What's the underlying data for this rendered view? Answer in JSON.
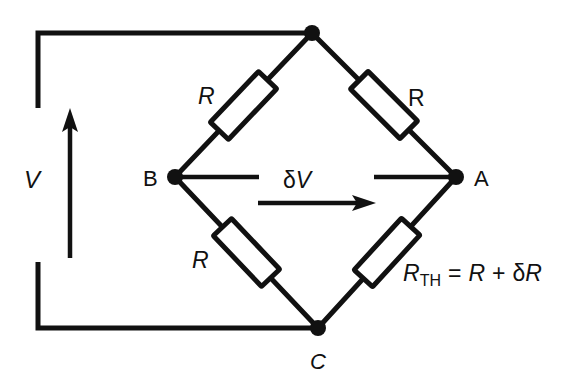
{
  "figure": {
    "type": "wheatstone-bridge-circuit-diagram",
    "background_color": "#ffffff",
    "stroke_color": "#111111"
  },
  "labels": {
    "source_voltage": "V",
    "node_a": "A",
    "node_b": "B",
    "node_c": "C",
    "resistor_top_left": "R",
    "resistor_top_right": "R",
    "resistor_bottom_left": "R",
    "bridge_voltage": "δV",
    "equation": {
      "symbol": "R",
      "subscript": "TH",
      "equals": "=",
      "term_one": "R",
      "plus": "+",
      "delta": "δ",
      "term_two": "R",
      "full_text": "R_TH = R + δR"
    }
  },
  "components": {
    "resistors": [
      {
        "name": "resistor-top-left",
        "label": "R",
        "branch": "B-to-top-node"
      },
      {
        "name": "resistor-top-right",
        "label": "R",
        "branch": "top-node-to-A"
      },
      {
        "name": "resistor-bottom-left",
        "label": "R",
        "branch": "B-to-C"
      },
      {
        "name": "resistor-bottom-right",
        "label": "R_TH = R + δR",
        "branch": "C-to-A"
      }
    ],
    "nodes": [
      {
        "name": "node-top",
        "label": ""
      },
      {
        "name": "node-b",
        "label": "B"
      },
      {
        "name": "node-a",
        "label": "A"
      },
      {
        "name": "node-c",
        "label": "C"
      }
    ],
    "arrows": [
      {
        "name": "voltage-arrow",
        "label": "V",
        "direction": "up"
      },
      {
        "name": "delta-v-arrow",
        "label": "δV",
        "direction": "right"
      }
    ]
  }
}
